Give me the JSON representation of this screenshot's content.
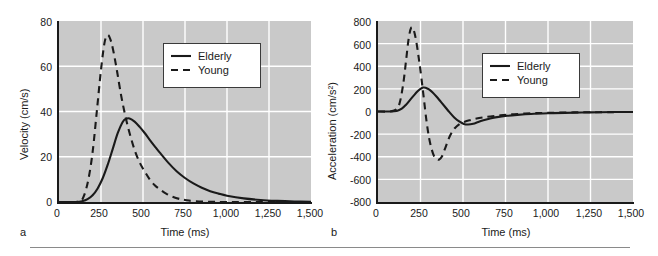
{
  "figure": {
    "panels": [
      {
        "letter": "a",
        "ylabel": "Velocity (cm/s)",
        "xlabel": "Time (ms)",
        "yticks": [
          "0",
          "20",
          "40",
          "60",
          "80"
        ],
        "xticks": [
          "0",
          "250",
          "500",
          "750",
          "1,000",
          "1,250",
          "1,500"
        ],
        "legend": [
          "Elderly",
          "Young"
        ]
      },
      {
        "letter": "b",
        "ylabel": "Acceleration (cm/s²)",
        "xlabel": "Time (ms)",
        "yticks": [
          "-800",
          "-600",
          "-400",
          "-200",
          "0",
          "200",
          "400",
          "600",
          "800"
        ],
        "xticks": [
          "0",
          "250",
          "500",
          "750",
          "1,000",
          "1,250",
          "1,500"
        ],
        "legend": [
          "Elderly",
          "Young"
        ]
      }
    ],
    "colors": {
      "plot_background": "#c9c9c9",
      "gridline": "#ffffff",
      "curve": "#1a1a1a",
      "axis": "#1a1a1a",
      "legend_background": "#ffffff",
      "rule": "#8a8a8a"
    }
  },
  "chart_data": [
    {
      "type": "line",
      "title": "",
      "panel": "a",
      "xlabel": "Time (ms)",
      "ylabel": "Velocity (cm/s)",
      "xlim": [
        0,
        1500
      ],
      "ylim": [
        0,
        80
      ],
      "xticks": [
        0,
        250,
        500,
        750,
        1000,
        1250,
        1500
      ],
      "yticks": [
        0,
        20,
        40,
        60,
        80
      ],
      "grid": true,
      "legend_position": "upper right",
      "series": [
        {
          "name": "Elderly",
          "linestyle": "solid",
          "x": [
            0,
            100,
            140,
            170,
            200,
            230,
            260,
            290,
            320,
            350,
            380,
            400,
            420,
            450,
            480,
            510,
            540,
            570,
            600,
            650,
            700,
            750,
            800,
            850,
            900,
            950,
            1000,
            1100,
            1200,
            1300,
            1400,
            1500
          ],
          "y": [
            0,
            0,
            0.4,
            1.3,
            3.0,
            6.0,
            10.5,
            16.5,
            23.5,
            30.5,
            35.5,
            36.8,
            36.9,
            35.5,
            33.2,
            30.5,
            27.5,
            24.6,
            21.8,
            17.4,
            13.6,
            10.6,
            8.2,
            6.3,
            4.8,
            3.7,
            2.8,
            1.6,
            0.9,
            0.5,
            0.25,
            0.1
          ]
        },
        {
          "name": "Young",
          "linestyle": "dashed",
          "x": [
            0,
            100,
            130,
            150,
            175,
            200,
            225,
            250,
            270,
            285,
            300,
            320,
            345,
            370,
            395,
            420,
            450,
            480,
            510,
            540,
            570,
            600,
            640,
            680,
            720,
            750,
            800,
            900,
            1000,
            1200,
            1500
          ],
          "y": [
            0,
            0,
            0.5,
            3.0,
            10.0,
            22.0,
            40.0,
            58.5,
            70.0,
            73.5,
            73.0,
            68.0,
            58.0,
            47.0,
            38.0,
            30.5,
            23.0,
            17.5,
            13.5,
            10.0,
            7.4,
            5.6,
            3.6,
            2.2,
            1.3,
            0.9,
            0.4,
            0.1,
            0,
            0,
            0
          ]
        }
      ],
      "annotations": {
        "elderly_peak": {
          "x": 410,
          "y": 37
        },
        "young_peak": {
          "x": 285,
          "y": 74
        }
      }
    },
    {
      "type": "line",
      "title": "",
      "panel": "b",
      "xlabel": "Time (ms)",
      "ylabel": "Acceleration (cm/s²)",
      "xlim": [
        0,
        1500
      ],
      "ylim": [
        -800,
        800
      ],
      "xticks": [
        0,
        250,
        500,
        750,
        1000,
        1250,
        1500
      ],
      "yticks": [
        -800,
        -600,
        -400,
        -200,
        0,
        200,
        400,
        600,
        800
      ],
      "grid": true,
      "legend_position": "upper right",
      "series": [
        {
          "name": "Elderly",
          "linestyle": "solid",
          "x": [
            0,
            60,
            110,
            140,
            165,
            190,
            210,
            230,
            250,
            265,
            280,
            300,
            320,
            345,
            370,
            395,
            420,
            450,
            480,
            505,
            530,
            560,
            590,
            620,
            660,
            700,
            760,
            820,
            900,
            1000,
            1100,
            1250,
            1400,
            1500
          ],
          "y": [
            0,
            0,
            5,
            25,
            60,
            105,
            140,
            175,
            200,
            212,
            210,
            195,
            170,
            130,
            85,
            40,
            -5,
            -55,
            -90,
            -110,
            -115,
            -108,
            -92,
            -78,
            -62,
            -50,
            -38,
            -30,
            -22,
            -16,
            -12,
            -8,
            -5,
            -4
          ]
        },
        {
          "name": "Young",
          "linestyle": "dashed",
          "x": [
            0,
            70,
            110,
            130,
            150,
            165,
            180,
            195,
            210,
            225,
            240,
            255,
            270,
            285,
            300,
            315,
            330,
            345,
            360,
            375,
            390,
            405,
            425,
            450,
            480,
            510,
            545,
            580,
            620,
            660,
            720,
            800,
            900,
            1000,
            1150,
            1300,
            1500
          ],
          "y": [
            0,
            0,
            20,
            90,
            260,
            450,
            640,
            740,
            720,
            620,
            470,
            300,
            110,
            -80,
            -230,
            -330,
            -395,
            -420,
            -425,
            -400,
            -345,
            -285,
            -210,
            -150,
            -110,
            -90,
            -75,
            -62,
            -52,
            -44,
            -34,
            -24,
            -16,
            -12,
            -8,
            -6,
            -4
          ]
        }
      ],
      "annotations": {
        "elderly_peak": {
          "x": 265,
          "y": 212
        },
        "elderly_trough": {
          "x": 530,
          "y": -115
        },
        "young_peak": {
          "x": 195,
          "y": 740
        },
        "young_trough": {
          "x": 360,
          "y": -425
        }
      }
    }
  ]
}
